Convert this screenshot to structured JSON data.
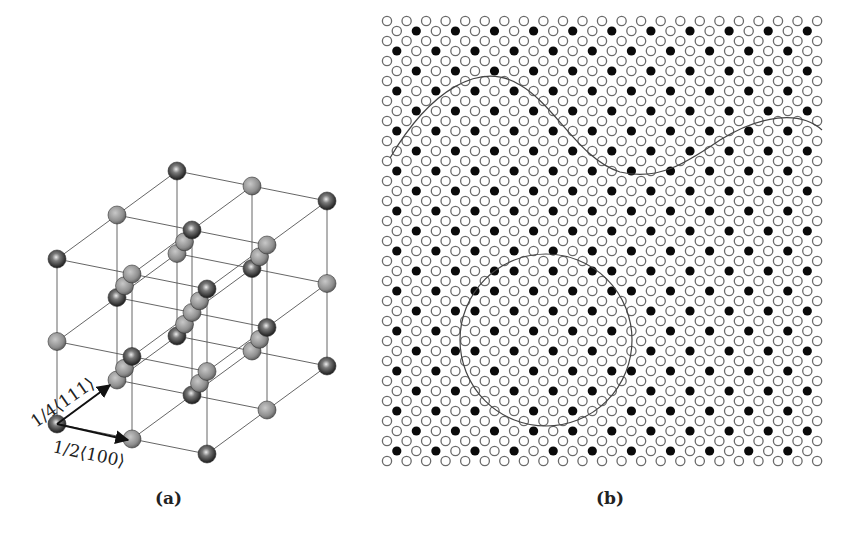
{
  "figure": {
    "panels": [
      {
        "id": "a",
        "label": "(a)",
        "title": "Diamond cubic crystal structure with lattice vectors"
      },
      {
        "id": "b",
        "label": "(b)",
        "title": "Atomic lattice map showing ordered domains and boundaries"
      }
    ],
    "panel_a": {
      "vectors": [
        {
          "label": "1/4⟨111⟩",
          "from": [
            57,
            424
          ],
          "to": [
            112,
            383
          ]
        },
        {
          "label": "1/2⟨100⟩",
          "from": [
            57,
            424
          ],
          "to": [
            130,
            440
          ]
        }
      ]
    },
    "panel_b": {
      "lattice": {
        "x0": 387,
        "y0": 21,
        "dx": 19.55,
        "dy": 10,
        "rows": 45,
        "cols_even": 23,
        "cols_odd": 22,
        "radius": 4.6,
        "open_stroke": "#6a6a6a",
        "filled_color": "#0a0a0a"
      },
      "circle_domain": {
        "cx": 546,
        "cy": 340,
        "r": 86
      },
      "wavy_boundary": "M390,158 C430,90 480,60 520,85 C555,105 580,160 620,172 C660,182 690,160 720,140 C760,115 800,110 822,130"
    },
    "colors": {
      "line": "#444444",
      "sphere_light": "#b8b8b8",
      "sphere_dark": "#2a2a2a"
    }
  }
}
